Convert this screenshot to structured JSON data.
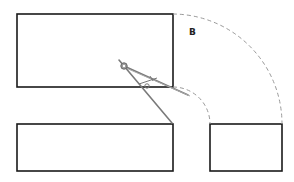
{
  "diagram": {
    "title": "",
    "labels": {
      "arc_label": "B"
    },
    "shapes": [
      {
        "id": "top-left-rectangle",
        "type": "rectangle"
      },
      {
        "id": "bottom-left-rectangle",
        "type": "rectangle"
      },
      {
        "id": "bottom-right-rectangle",
        "type": "rectangle"
      },
      {
        "id": "outer-arc",
        "type": "dashed-arc"
      },
      {
        "id": "inner-arc",
        "type": "dashed-arc"
      },
      {
        "id": "compass",
        "type": "drawing-compass"
      }
    ],
    "colors": {
      "outline": "#1a1a1a",
      "arc": "#9a9a9a",
      "compass": "#7a7a7a"
    }
  }
}
